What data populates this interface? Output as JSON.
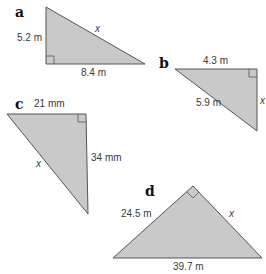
{
  "colors": {
    "fill": "#c9c9c9",
    "stroke": "#555555",
    "text": "#3a3a3a"
  },
  "triangles": {
    "a": {
      "letter": "a",
      "side1": "5.2 m",
      "side2": "8.4 m",
      "unknown": "x"
    },
    "b": {
      "letter": "b",
      "side1": "4.3 m",
      "side2": "5.9 m",
      "unknown": "x"
    },
    "c": {
      "letter": "c",
      "side1": "21 mm",
      "side2": "34 mm",
      "unknown": "x"
    },
    "d": {
      "letter": "d",
      "side1": "24.5 m",
      "side2": "39.7 m",
      "unknown": "x"
    }
  }
}
